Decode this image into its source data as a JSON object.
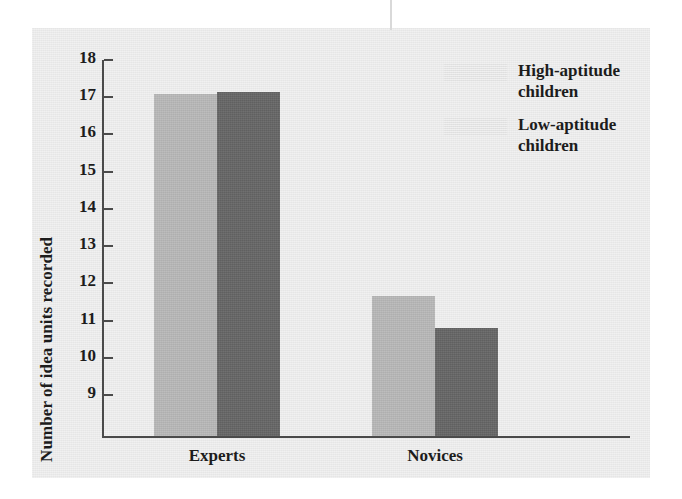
{
  "chart_data": {
    "type": "bar",
    "title": "",
    "subtitle": "",
    "xlabel": "",
    "ylabel": "Number of idea units recorded",
    "categories": [
      "Experts",
      "Novices"
    ],
    "ylim": [
      8.2,
      18
    ],
    "yticks": [
      18,
      17,
      16,
      15,
      14,
      13,
      12,
      11,
      10,
      9
    ],
    "ytick_labels": [
      "18",
      "17",
      "16",
      "15",
      "14",
      "13",
      "12",
      "11",
      "10",
      "9"
    ],
    "grid": false,
    "legend_position": "top-right",
    "series": [
      {
        "name": "High-aptitude children",
        "color": "#b9b9b9",
        "values": [
          17.1,
          11.65
        ]
      },
      {
        "name": "Low-aptitude children",
        "color": "#666666",
        "values": [
          17.15,
          10.8
        ]
      }
    ],
    "annotations": []
  },
  "figure": {
    "panel_background": "#eaeaea",
    "axis_color": "#4a4a4a",
    "text_color": "#1c1c1c"
  },
  "legend": {
    "items": [
      {
        "label_line1": "High-aptitude",
        "label_line2": "children",
        "swatch": "#b9b9b9",
        "swatch_name": "legend-swatch-high-aptitude"
      },
      {
        "label_line1": "Low-aptitude",
        "label_line2": "children",
        "swatch": "#666666",
        "swatch_name": "legend-swatch-low-aptitude"
      }
    ]
  }
}
